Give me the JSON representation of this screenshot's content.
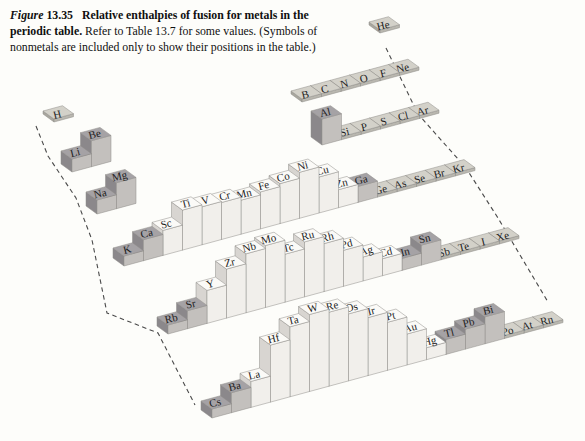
{
  "figure": {
    "label_word": "Figure",
    "label_number": "13.35",
    "title_bold": "Relative enthalpies of fusion for metals in the periodic table.",
    "caption_rest": "Refer to Table 13.7 for some values. (Symbols of nonmetals are included only to show their positions in the table.)"
  },
  "colors": {
    "background": "#fdfdfa",
    "light_top": "#fbfaf7",
    "light_front": "#f1efeb",
    "light_side": "#d8d5d1",
    "dark_top": "#a5a2a5",
    "dark_front": "#c3c0bd",
    "dark_side": "#8b888b",
    "tile_top": "#d3d1c9",
    "tile_front": "#b9b7af",
    "tile_side": "#a8a69e",
    "stroke": "#8f8c88",
    "dash": "#4a4a4a",
    "label": "#1c1c1c"
  },
  "chart_data": {
    "type": "bar",
    "projection": "3d-isometric periodic table",
    "title": "Relative enthalpies of fusion for metals in the periodic table",
    "value_note": "bar heights are schematic relative enthalpies of fusion (arbitrary units, read from figure in px)",
    "styles_meaning": {
      "dark": "main-group (s- and p-block) metals, shaded blocks",
      "light": "transition metals, white bars",
      "tile": "nonmetals and noble gases, flat tiles (positions only)"
    },
    "segments": [
      {
        "name": "period1-s",
        "base": [
          54,
          122
        ],
        "elements": [
          {
            "symbol": "H",
            "h": 3,
            "style": "tile"
          }
        ]
      },
      {
        "name": "period1-p",
        "base": [
          380,
          33
        ],
        "elements": [
          {
            "symbol": "He",
            "h": 3,
            "style": "tile"
          }
        ]
      },
      {
        "name": "period2-p",
        "base": [
          302,
          102
        ],
        "elements": [
          {
            "symbol": "B",
            "h": 3,
            "style": "tile"
          },
          {
            "symbol": "C",
            "h": 3,
            "style": "tile"
          },
          {
            "symbol": "N",
            "h": 3,
            "style": "tile"
          },
          {
            "symbol": "O",
            "h": 3,
            "style": "tile"
          },
          {
            "symbol": "F",
            "h": 3,
            "style": "tile"
          },
          {
            "symbol": "Ne",
            "h": 3,
            "style": "tile"
          }
        ]
      },
      {
        "name": "period2-s",
        "base": [
          72,
          172
        ],
        "elements": [
          {
            "symbol": "Li",
            "h": 13,
            "style": "dark"
          },
          {
            "symbol": "Be",
            "h": 26,
            "style": "dark"
          }
        ]
      },
      {
        "name": "period3-p",
        "base": [
          322,
          145
        ],
        "elements": [
          {
            "symbol": "Al",
            "h": 26,
            "style": "dark"
          },
          {
            "symbol": "Si",
            "h": 3,
            "style": "tile"
          },
          {
            "symbol": "P",
            "h": 3,
            "style": "tile"
          },
          {
            "symbol": "S",
            "h": 3,
            "style": "tile"
          },
          {
            "symbol": "Cl",
            "h": 3,
            "style": "tile"
          },
          {
            "symbol": "Ar",
            "h": 3,
            "style": "tile"
          }
        ]
      },
      {
        "name": "period3-s",
        "base": [
          97,
          214
        ],
        "elements": [
          {
            "symbol": "Na",
            "h": 14,
            "style": "dark"
          },
          {
            "symbol": "Mg",
            "h": 26,
            "style": "dark"
          }
        ]
      },
      {
        "name": "period4",
        "base": [
          124,
          266
        ],
        "elements": [
          {
            "symbol": "K",
            "h": 10,
            "style": "dark"
          },
          {
            "symbol": "Ca",
            "h": 21,
            "style": "dark"
          },
          {
            "symbol": "Sc",
            "h": 25,
            "style": "light"
          },
          {
            "symbol": "Ti",
            "h": 40,
            "style": "light"
          },
          {
            "symbol": "V",
            "h": 38,
            "style": "light"
          },
          {
            "symbol": "Cr",
            "h": 37,
            "style": "light"
          },
          {
            "symbol": "Mn",
            "h": 34,
            "style": "light"
          },
          {
            "symbol": "Fe",
            "h": 37,
            "style": "light"
          },
          {
            "symbol": "Co",
            "h": 40,
            "style": "light"
          },
          {
            "symbol": "Ni",
            "h": 46,
            "style": "light"
          },
          {
            "symbol": "Cu",
            "h": 36,
            "style": "light"
          },
          {
            "symbol": "Zn",
            "h": 18,
            "style": "light"
          },
          {
            "symbol": "Ga",
            "h": 16,
            "style": "dark"
          },
          {
            "symbol": "Ge",
            "h": 3,
            "style": "tile"
          },
          {
            "symbol": "As",
            "h": 3,
            "style": "tile"
          },
          {
            "symbol": "Se",
            "h": 3,
            "style": "tile"
          },
          {
            "symbol": "Br",
            "h": 3,
            "style": "tile"
          },
          {
            "symbol": "Kr",
            "h": 3,
            "style": "tile"
          }
        ]
      },
      {
        "name": "period5",
        "base": [
          168,
          334
        ],
        "elements": [
          {
            "symbol": "Rb",
            "h": 9,
            "style": "dark"
          },
          {
            "symbol": "Sr",
            "h": 18,
            "style": "dark"
          },
          {
            "symbol": "Y",
            "h": 33,
            "style": "light"
          },
          {
            "symbol": "Zr",
            "h": 49,
            "style": "light"
          },
          {
            "symbol": "Nb",
            "h": 59,
            "style": "light"
          },
          {
            "symbol": "Mo",
            "h": 62,
            "style": "light"
          },
          {
            "symbol": "Tc",
            "h": 48,
            "style": "light"
          },
          {
            "symbol": "Ru",
            "h": 55,
            "style": "light"
          },
          {
            "symbol": "Rh",
            "h": 48,
            "style": "light"
          },
          {
            "symbol": "Pd",
            "h": 36,
            "style": "light"
          },
          {
            "symbol": "Ag",
            "h": 24,
            "style": "light"
          },
          {
            "symbol": "Cd",
            "h": 17,
            "style": "light"
          },
          {
            "symbol": "In",
            "h": 12,
            "style": "dark"
          },
          {
            "symbol": "Sn",
            "h": 20,
            "style": "dark"
          },
          {
            "symbol": "Sb",
            "h": 3,
            "style": "tile"
          },
          {
            "symbol": "Te",
            "h": 3,
            "style": "tile"
          },
          {
            "symbol": "I",
            "h": 3,
            "style": "tile"
          },
          {
            "symbol": "Xe",
            "h": 3,
            "style": "tile"
          }
        ]
      },
      {
        "name": "period6",
        "base": [
          212,
          418
        ],
        "elements": [
          {
            "symbol": "Cs",
            "h": 9,
            "style": "dark"
          },
          {
            "symbol": "Ba",
            "h": 20,
            "style": "dark"
          },
          {
            "symbol": "La",
            "h": 26,
            "style": "light"
          },
          {
            "symbol": "Hf",
            "h": 57,
            "style": "light"
          },
          {
            "symbol": "Ta",
            "h": 70,
            "style": "light"
          },
          {
            "symbol": "W",
            "h": 77,
            "style": "light"
          },
          {
            "symbol": "Re",
            "h": 74,
            "style": "light"
          },
          {
            "symbol": "Os",
            "h": 67,
            "style": "light"
          },
          {
            "symbol": "Ir",
            "h": 58,
            "style": "light"
          },
          {
            "symbol": "Pt",
            "h": 48,
            "style": "light"
          },
          {
            "symbol": "Au",
            "h": 31,
            "style": "light"
          },
          {
            "symbol": "Hg",
            "h": 12,
            "style": "light"
          },
          {
            "symbol": "Tl",
            "h": 15,
            "style": "dark"
          },
          {
            "symbol": "Pb",
            "h": 20,
            "style": "dark"
          },
          {
            "symbol": "Bi",
            "h": 27,
            "style": "dark"
          },
          {
            "symbol": "Po",
            "h": 3,
            "style": "tile"
          },
          {
            "symbol": "At",
            "h": 3,
            "style": "tile"
          },
          {
            "symbol": "Rn",
            "h": 3,
            "style": "tile"
          }
        ]
      }
    ],
    "boundary_dashes": {
      "left": [
        [
          36,
          126
        ],
        [
          48,
          156
        ],
        [
          76,
          198
        ],
        [
          92,
          240
        ],
        [
          107,
          313
        ],
        [
          158,
          333
        ],
        [
          195,
          405
        ]
      ],
      "right": [
        [
          386,
          48
        ],
        [
          418,
          114
        ],
        [
          466,
          168
        ],
        [
          498,
          218
        ],
        [
          548,
          302
        ]
      ]
    }
  }
}
